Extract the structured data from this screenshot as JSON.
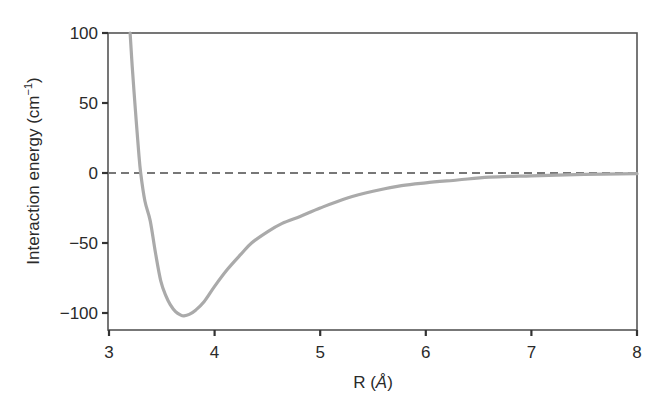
{
  "chart_data": {
    "type": "line",
    "title": "",
    "xlabel": "R (Å)",
    "xlabel_parts": {
      "prefix": "R (",
      "unit": "Å",
      "suffix": ")"
    },
    "ylabel": "Interaction energy (cm−1)",
    "ylabel_parts": {
      "main": "Interaction energy (cm",
      "sup": "−1",
      "close": ")"
    },
    "xlim": [
      3,
      8
    ],
    "ylim": [
      -112,
      100
    ],
    "xticks": [
      3,
      4,
      5,
      6,
      7,
      8
    ],
    "xtick_labels": [
      "3",
      "4",
      "5",
      "6",
      "7",
      "8"
    ],
    "yticks": [
      100,
      50,
      0,
      -50,
      -100
    ],
    "ytick_labels": [
      "100",
      "50",
      "0",
      "−50",
      "−100"
    ],
    "grid": false,
    "legend": null,
    "reference_line": {
      "y": 0,
      "style": "dashed",
      "color": "#777777"
    },
    "series": [
      {
        "name": "interaction energy",
        "color": "#aaaaaa",
        "x": [
          3.2,
          3.22,
          3.25,
          3.28,
          3.3,
          3.34,
          3.39,
          3.44,
          3.49,
          3.54,
          3.58,
          3.63,
          3.68,
          3.71,
          3.76,
          3.82,
          3.9,
          4.0,
          4.12,
          4.25,
          4.35,
          4.5,
          4.64,
          4.81,
          5.0,
          5.25,
          5.5,
          5.77,
          6.0,
          6.3,
          6.6,
          7.0,
          7.5,
          8.0
        ],
        "y": [
          100,
          76,
          45,
          16,
          0,
          -20,
          -34,
          -57,
          -77,
          -88,
          -94,
          -99,
          -101.5,
          -102,
          -101,
          -98,
          -92,
          -81,
          -69,
          -58,
          -50,
          -42,
          -36,
          -31,
          -25,
          -18,
          -13,
          -9,
          -7,
          -5,
          -3,
          -2,
          -1,
          -0.5
        ]
      }
    ],
    "annotations": []
  }
}
